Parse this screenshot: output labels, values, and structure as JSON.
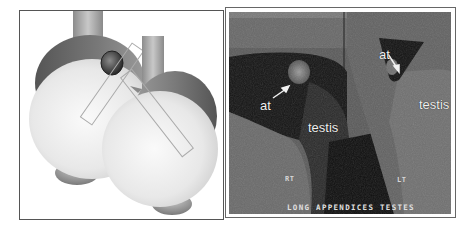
{
  "figure": {
    "illustration": {
      "description": "Schematic drawing of left and right testes with appendix testis and probe positions",
      "colors": {
        "testis_light": "#e6e6e6",
        "epididymis_dark": "#6a6a6a",
        "appendix_dark": "#3c3c3c",
        "cord": "#a8a8a8"
      }
    },
    "ultrasound": {
      "labels": {
        "right_appendix": "at",
        "right_testis": "testis",
        "left_appendix": "at",
        "left_testis": "testis",
        "right_side_marker": "RT",
        "left_side_marker": "LT"
      },
      "caption": "LONG APPENDICES TESTES"
    }
  }
}
